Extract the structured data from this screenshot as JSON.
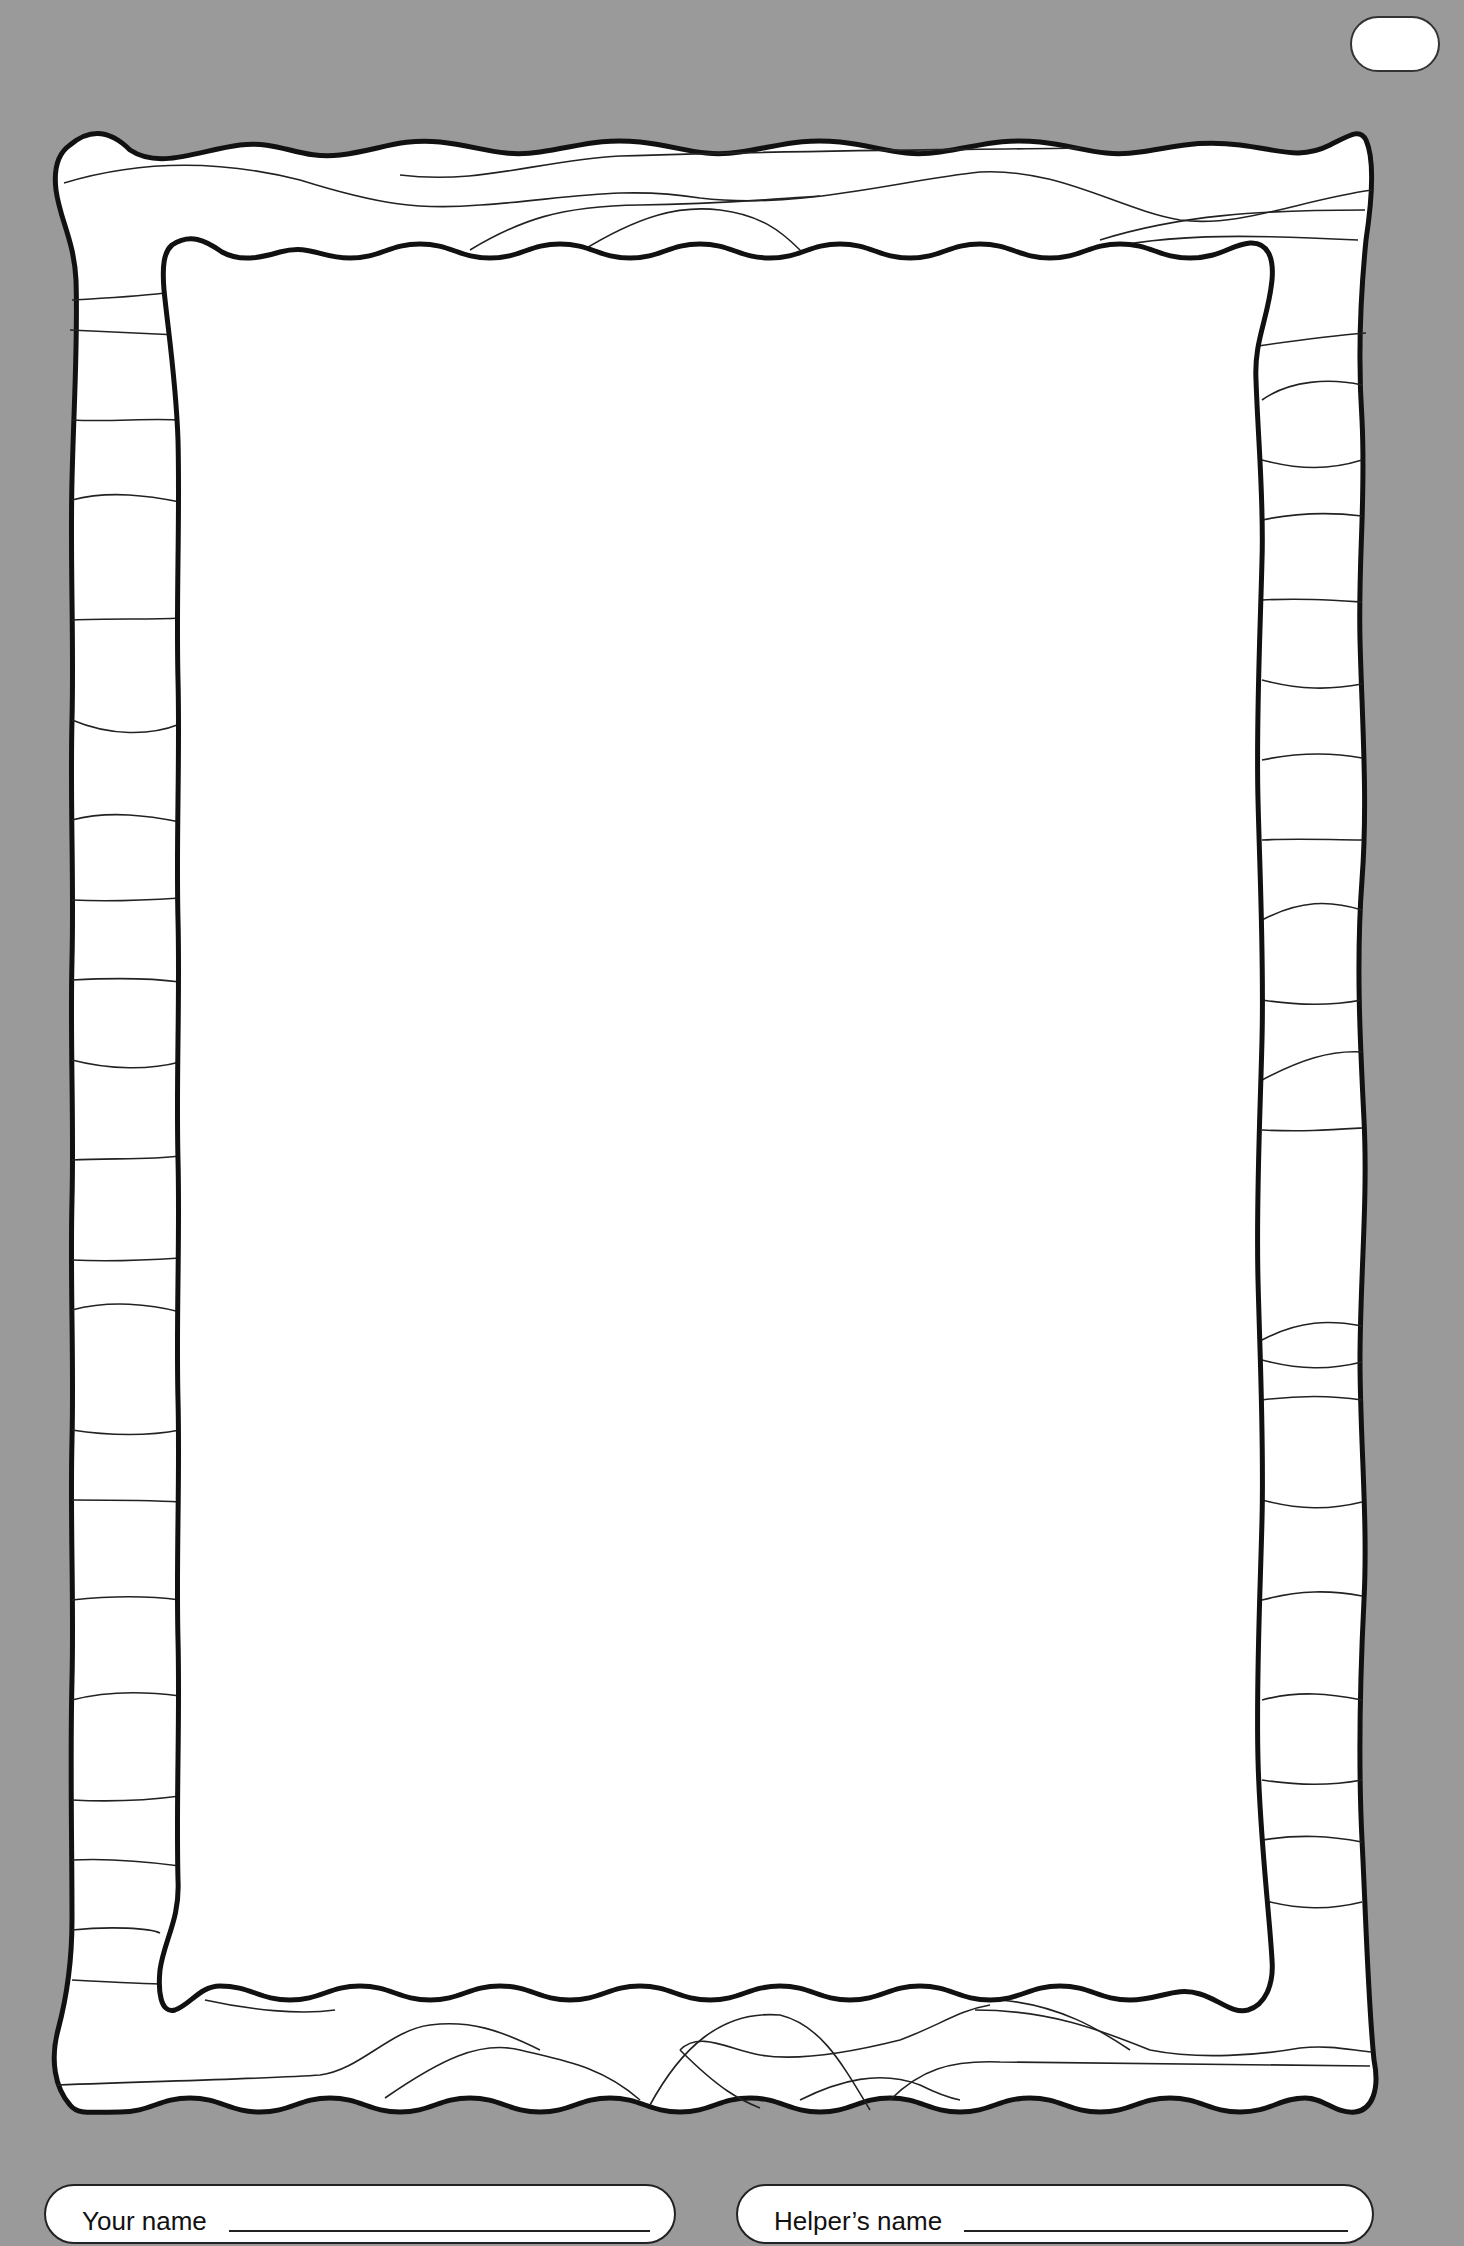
{
  "page": {
    "background_color": "#9a9a9a",
    "frame_fill": "#ffffff",
    "frame_stroke": "#111111",
    "page_tag_text": ""
  },
  "drawing_area": {
    "content": ""
  },
  "footer": {
    "your_name": {
      "label": "Your name",
      "value": ""
    },
    "helper_name": {
      "label": "Helper’s name",
      "value": ""
    }
  }
}
